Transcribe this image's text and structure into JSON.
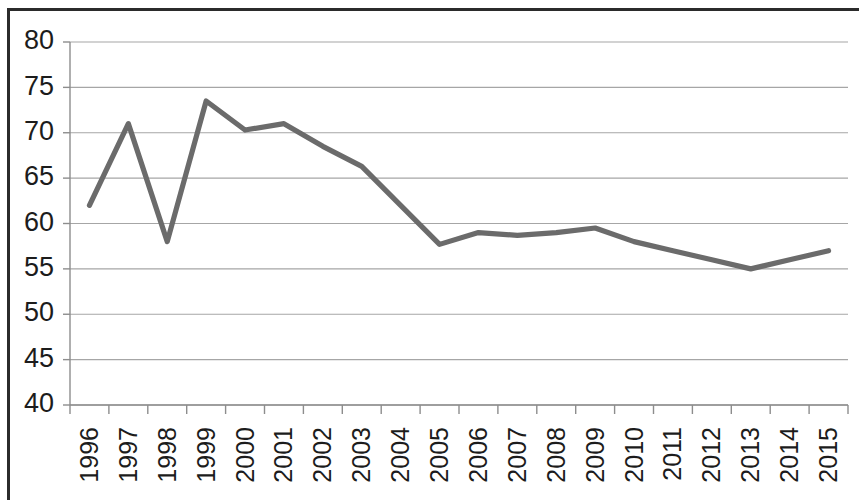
{
  "chart_data": {
    "type": "line",
    "title": "",
    "subtitle": "",
    "xlabel": "",
    "ylabel": "",
    "categories": [
      "1996",
      "1997",
      "1998",
      "1999",
      "2000",
      "2001",
      "2002",
      "2003",
      "2004",
      "2005",
      "2006",
      "2007",
      "2008",
      "2009",
      "2010",
      "2011",
      "2012",
      "2013",
      "2014",
      "2015"
    ],
    "values": [
      62.0,
      71.0,
      58.0,
      73.5,
      70.3,
      71.0,
      68.5,
      66.3,
      62.0,
      57.7,
      59.0,
      58.7,
      59.0,
      59.5,
      58.0,
      57.0,
      56.0,
      55.0,
      56.0,
      57.0
    ],
    "series": [
      {
        "name": "series-1",
        "values": [
          62.0,
          71.0,
          58.0,
          73.5,
          70.3,
          71.0,
          68.5,
          66.3,
          62.0,
          57.7,
          59.0,
          58.7,
          59.0,
          59.5,
          58.0,
          57.0,
          56.0,
          55.0,
          56.0,
          57.0
        ]
      }
    ],
    "ylim": [
      40,
      80
    ],
    "ytick_step": 5,
    "ytick_labels": [
      "80",
      "75",
      "70",
      "65",
      "60",
      "55",
      "50",
      "45",
      "40"
    ],
    "ytick_values": [
      80,
      75,
      70,
      65,
      60,
      55,
      50,
      45,
      40
    ],
    "grid": true,
    "grid_axis": "y",
    "legend": false,
    "legend_position": "none",
    "xtick_rotation": 90,
    "markers": false,
    "annotations": []
  },
  "style": {
    "line_color": "#6b6b6b",
    "gridline_color": "#a6a6a6",
    "axis_color": "#8d8d8d",
    "text_color": "#1c1c1c",
    "frame_color": "#2b2b2b",
    "background_color": "#ffffff"
  }
}
